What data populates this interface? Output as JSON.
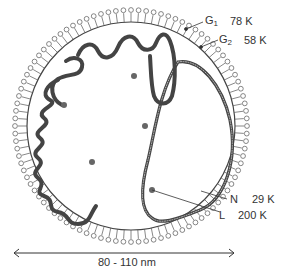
{
  "diagram": {
    "labels": [
      {
        "id": "G1",
        "letter": "G",
        "sub": "1",
        "mass": "78 K",
        "component": "envelope glycoprotein"
      },
      {
        "id": "G2",
        "letter": "G",
        "sub": "2",
        "mass": "58 K",
        "component": "envelope glycoprotein"
      },
      {
        "id": "N",
        "letter": "N",
        "sub": "",
        "mass": "29 K",
        "component": "nucleocapsid protein"
      },
      {
        "id": "L",
        "letter": "L",
        "sub": "",
        "mass": "200 K",
        "component": "polymerase"
      }
    ],
    "scale": {
      "text": "80 - 110 nm"
    },
    "colors": {
      "stroke": "#333333",
      "strand": "#555555",
      "background": "#ffffff"
    }
  }
}
